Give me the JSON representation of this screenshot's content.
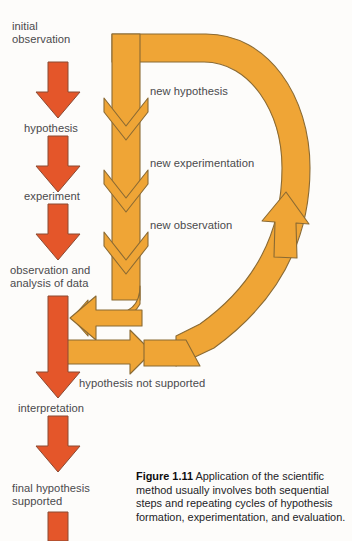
{
  "figure": {
    "number": "Figure 1.11",
    "caption_text": " Application of the scientific method usually involves both sequential steps and repeating cycles of hypothesis formation, experimentation, and evaluation."
  },
  "colors": {
    "red_arrow_fill": "#E4562A",
    "red_arrow_stroke": "#8a4a33",
    "orange_path_fill": "#EFA536",
    "orange_path_stroke": "#8a6a33",
    "background": "#fdfcfa",
    "label_text": "#4a4a4c",
    "caption_text": "#232326"
  },
  "main_sequence": {
    "steps": [
      {
        "id": "initial-observation",
        "line1": "initial",
        "line2": "observation"
      },
      {
        "id": "hypothesis",
        "line1": "hypothesis",
        "line2": ""
      },
      {
        "id": "experiment",
        "line1": "experiment",
        "line2": ""
      },
      {
        "id": "observation-analysis",
        "line1": "observation and",
        "line2": "analysis of data"
      },
      {
        "id": "interpretation",
        "line1": "interpretation",
        "line2": ""
      },
      {
        "id": "final-hypothesis",
        "line1": "final hypothesis",
        "line2": "supported"
      }
    ]
  },
  "cycle_labels": [
    {
      "id": "new-hypothesis",
      "text": "new hypothesis"
    },
    {
      "id": "new-experimentation",
      "text": "new experimentation"
    },
    {
      "id": "new-observation",
      "text": "new observation"
    }
  ],
  "feedback_label": {
    "id": "hypothesis-not-supported",
    "text": "hypothesis not supported"
  }
}
